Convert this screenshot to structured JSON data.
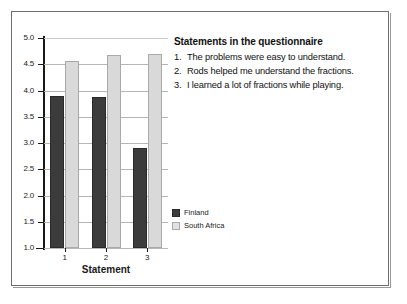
{
  "chart_data": {
    "type": "bar",
    "title": "",
    "xlabel": "Statement",
    "ylabel": "",
    "categories": [
      "1",
      "2",
      "3"
    ],
    "ylim": [
      1.0,
      5.0
    ],
    "yticks": [
      "1.0",
      "1.5",
      "2.0",
      "2.5",
      "3.0",
      "3.5",
      "4.0",
      "4.5",
      "5.0"
    ],
    "ytick_values": [
      1.0,
      1.5,
      2.0,
      2.5,
      3.0,
      3.5,
      4.0,
      4.5,
      5.0
    ],
    "grid": true,
    "legend_position": "center-right",
    "series": [
      {
        "name": "Finland",
        "color": "#3c3c3c",
        "values": [
          3.9,
          3.88,
          2.9
        ]
      },
      {
        "name": "South Africa",
        "color": "#d9d9d9",
        "values": [
          4.57,
          4.67,
          4.7
        ]
      }
    ]
  },
  "statements": {
    "heading": "Statements in the questionnaire",
    "items": [
      {
        "num": "1.",
        "text": "The problems were easy to understand."
      },
      {
        "num": "2.",
        "text": "Rods helped me understand the fractions."
      },
      {
        "num": "3.",
        "text": "I learned a lot of fractions while playing."
      }
    ]
  }
}
